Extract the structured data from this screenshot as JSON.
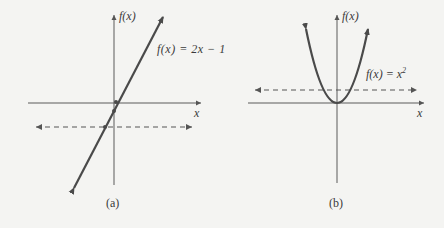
{
  "panel_a": {
    "caption": "(a)",
    "y_axis_label": "f(x)",
    "x_axis_label": "x",
    "function_label": "f(x) = 2x − 1"
  },
  "panel_b": {
    "caption": "(b)",
    "y_axis_label": "f(x)",
    "x_axis_label": "x",
    "function_label_base": "f(x) = x",
    "function_label_exp": "2"
  },
  "colors": {
    "curve": "#4a4a4a",
    "axis": "#5a5a5a",
    "background": "#f4f4f2"
  }
}
